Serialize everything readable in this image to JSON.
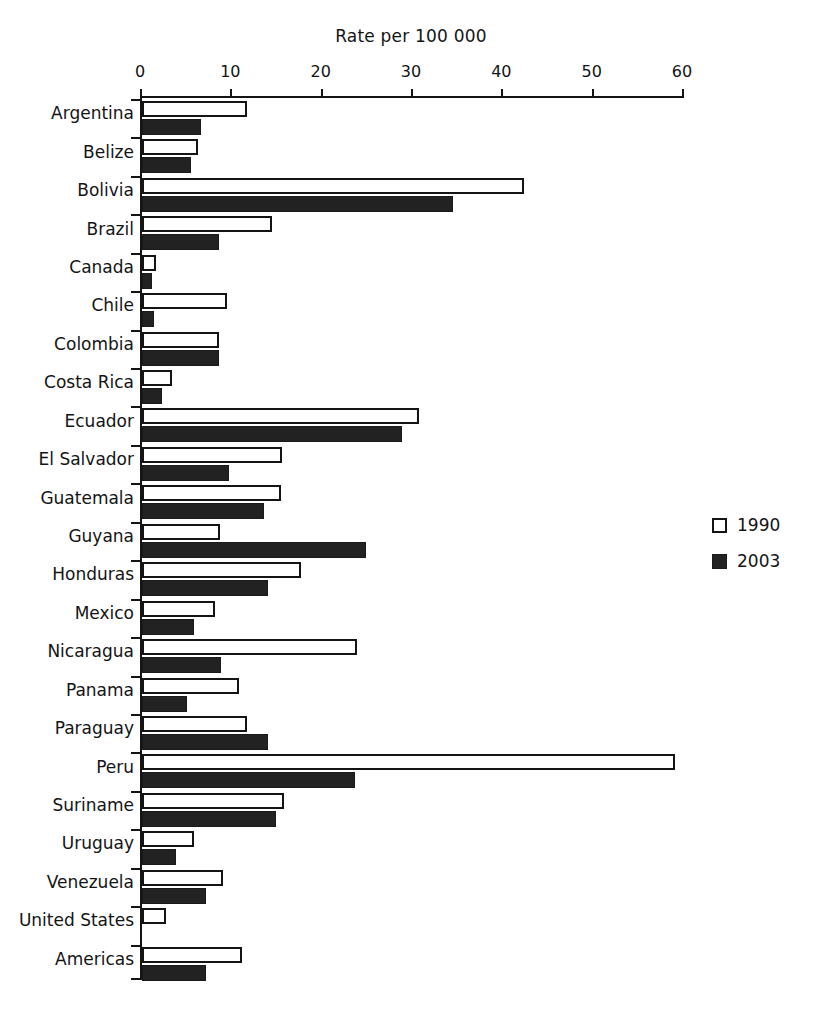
{
  "chart_data": {
    "type": "bar",
    "orientation": "horizontal",
    "title": "",
    "xlabel": "Rate per 100 000",
    "ylabel": "",
    "xlim": [
      0,
      60
    ],
    "xticks": [
      0,
      10,
      20,
      30,
      40,
      50,
      60
    ],
    "xtick_labels": [
      "0",
      "10",
      "20",
      "30",
      "40",
      "50",
      "60"
    ],
    "grid": false,
    "legend_position": "right",
    "categories": [
      "Argentina",
      "Belize",
      "Bolivia",
      "Brazil",
      "Canada",
      "Chile",
      "Colombia",
      "Costa Rica",
      "Ecuador",
      "El Salvador",
      "Guatemala",
      "Guyana",
      "Honduras",
      "Mexico",
      "Nicaragua",
      "Panama",
      "Paraguay",
      "Peru",
      "Suriname",
      "Uruguay",
      "Venezuela",
      "United States",
      "Americas"
    ],
    "series": [
      {
        "name": "1990",
        "color": "#ffffff",
        "edge_color": "#141414",
        "values": [
          11.6,
          6.2,
          42.3,
          14.4,
          1.5,
          9.4,
          8.5,
          3.3,
          30.7,
          15.5,
          15.4,
          8.6,
          17.6,
          8.1,
          23.8,
          10.7,
          11.6,
          59.0,
          15.7,
          5.8,
          9.0,
          2.7,
          11.1
        ]
      },
      {
        "name": "2003",
        "color": "#222222",
        "edge_color": "#1a1a1a",
        "values": [
          6.5,
          5.4,
          34.4,
          8.5,
          1.1,
          1.3,
          8.5,
          2.2,
          28.8,
          9.6,
          13.5,
          24.8,
          14.0,
          5.8,
          8.7,
          5.0,
          14.0,
          23.6,
          14.8,
          3.8,
          7.1,
          0.0,
          7.1
        ]
      }
    ]
  },
  "legend": {
    "entries": [
      {
        "label": "1990",
        "swatch": "hollow-square"
      },
      {
        "label": "2003",
        "swatch": "filled-square"
      }
    ]
  }
}
